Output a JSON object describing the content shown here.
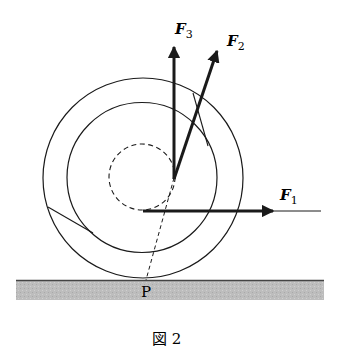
{
  "figure": {
    "caption": "図 2",
    "point_label": "P",
    "forces": [
      {
        "id": "F1",
        "symbol": "F",
        "subscript": "1"
      },
      {
        "id": "F2",
        "symbol": "F",
        "subscript": "2"
      },
      {
        "id": "F3",
        "symbol": "F",
        "subscript": "3"
      }
    ],
    "colors": {
      "line": "#1a1a1a",
      "ground_fill": "#b9b9b9",
      "ground_edge": "#444444"
    }
  }
}
